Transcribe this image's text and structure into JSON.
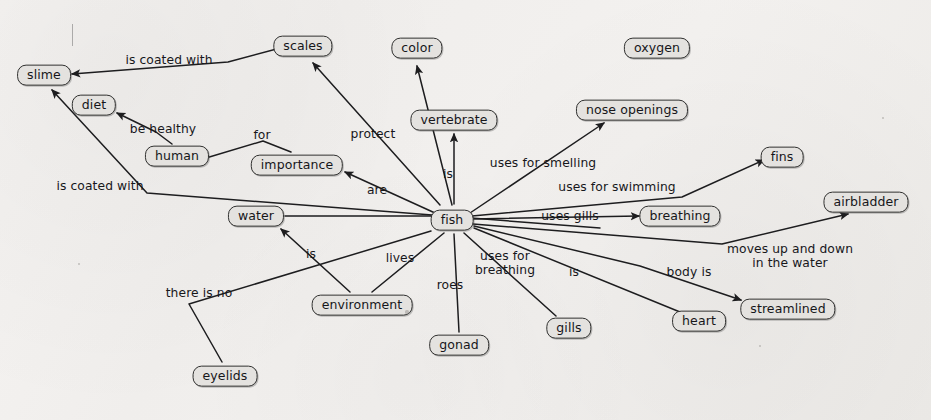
{
  "diagram": {
    "width": 931,
    "height": 420,
    "node_fill": "#e4e2df",
    "node_stroke": "#30302f",
    "edge_stroke": "#1d1d1f",
    "background": "#f2f0ee",
    "nodes": [
      {
        "id": "slime",
        "label": "slime",
        "x": 44,
        "y": 75
      },
      {
        "id": "diet",
        "label": "diet",
        "x": 94,
        "y": 105
      },
      {
        "id": "human",
        "label": "human",
        "x": 177,
        "y": 156
      },
      {
        "id": "scales",
        "label": "scales",
        "x": 303,
        "y": 46
      },
      {
        "id": "color",
        "label": "color",
        "x": 417,
        "y": 48
      },
      {
        "id": "oxygen",
        "label": "oxygen",
        "x": 657,
        "y": 48
      },
      {
        "id": "vertebrate",
        "label": "vertebrate",
        "x": 454,
        "y": 120
      },
      {
        "id": "nose_openings",
        "label": "nose openings",
        "x": 632,
        "y": 110
      },
      {
        "id": "importance",
        "label": "importance",
        "x": 297,
        "y": 165
      },
      {
        "id": "fins",
        "label": "fins",
        "x": 782,
        "y": 157
      },
      {
        "id": "airbladder",
        "label": "airbladder",
        "x": 866,
        "y": 202
      },
      {
        "id": "water",
        "label": "water",
        "x": 256,
        "y": 216
      },
      {
        "id": "fish",
        "label": "fish",
        "x": 452,
        "y": 220
      },
      {
        "id": "breathing",
        "label": "breathing",
        "x": 680,
        "y": 216
      },
      {
        "id": "environment",
        "label": "environment",
        "x": 362,
        "y": 305
      },
      {
        "id": "streamlined",
        "label": "streamlined",
        "x": 788,
        "y": 309
      },
      {
        "id": "heart",
        "label": "heart",
        "x": 699,
        "y": 321
      },
      {
        "id": "gills",
        "label": "gills",
        "x": 569,
        "y": 328
      },
      {
        "id": "gonad",
        "label": "gonad",
        "x": 459,
        "y": 345
      },
      {
        "id": "eyelids",
        "label": "eyelids",
        "x": 225,
        "y": 376
      }
    ],
    "edges": [
      {
        "id": "scales-slime",
        "from": "scales",
        "to": "slime",
        "label": "is coated with",
        "label_x": 169,
        "label_y": 60,
        "arrow": true,
        "points": "284,47 228,62 72,74"
      },
      {
        "id": "fish-scales",
        "from": "fish",
        "to": "scales",
        "label": "protect",
        "label_x": 373,
        "label_y": 134,
        "arrow": true,
        "points": "440,205 313,63"
      },
      {
        "id": "fish-color",
        "from": "fish",
        "to": "color",
        "label": "",
        "label_x": 0,
        "label_y": 0,
        "arrow": true,
        "points": "452,205 417,66"
      },
      {
        "id": "fish-vertebrate",
        "from": "fish",
        "to": "vertebrate",
        "label": "is",
        "label_x": 448,
        "label_y": 174,
        "arrow": true,
        "points": "454,204 454,134"
      },
      {
        "id": "fish-nose",
        "from": "fish",
        "to": "nose_openings",
        "label": "uses for smelling",
        "label_x": 543,
        "label_y": 163,
        "arrow": true,
        "points": "470,213 604,123"
      },
      {
        "id": "fish-fins",
        "from": "fish",
        "to": "fins",
        "label": "uses for swimming",
        "label_x": 617,
        "label_y": 187,
        "arrow": true,
        "points": "472,216 682,197 764,160"
      },
      {
        "id": "fish-breathing",
        "from": "fish",
        "to": "breathing",
        "label": "uses gills",
        "label_x": 570,
        "label_y": 216,
        "arrow": true,
        "points": "473,219 639,216"
      },
      {
        "id": "fish-airbladder",
        "from": "fish",
        "to": "airbladder",
        "label": "moves up and down\nin the water",
        "label_x": 790,
        "label_y": 256,
        "arrow": true,
        "points": "473,224 722,244 848,214"
      },
      {
        "id": "fish-importance",
        "from": "fish",
        "to": "importance",
        "label": "are",
        "label_x": 377,
        "label_y": 190,
        "arrow": true,
        "points": "435,213 345,172"
      },
      {
        "id": "fish-water",
        "from": "fish",
        "to": "water",
        "label": "",
        "label_x": 0,
        "label_y": 0,
        "arrow": false,
        "points": "432,216 285,216"
      },
      {
        "id": "fish-environment",
        "from": "fish",
        "to": "environment",
        "label": "lives",
        "label_x": 400,
        "label_y": 258,
        "arrow": false,
        "points": "444,233 372,292"
      },
      {
        "id": "fish-gonad",
        "from": "fish",
        "to": "gonad",
        "label": "roes",
        "label_x": 450,
        "label_y": 285,
        "arrow": false,
        "points": "454,234 459,332"
      },
      {
        "id": "fish-gills",
        "from": "fish",
        "to": "gills",
        "label": "uses for\nbreathing",
        "label_x": 505,
        "label_y": 263,
        "arrow": false,
        "points": "464,233 556,316"
      },
      {
        "id": "fish-heart",
        "from": "fish",
        "to": "heart",
        "label": "is",
        "label_x": 574,
        "label_y": 272,
        "arrow": false,
        "points": "474,228 680,312"
      },
      {
        "id": "fish-streamlined",
        "from": "fish",
        "to": "streamlined",
        "label": "body is",
        "label_x": 689,
        "label_y": 272,
        "arrow": true,
        "points": "474,226 640,266 741,300"
      },
      {
        "id": "human-diet",
        "from": "human",
        "to": "diet",
        "label": "be healthy",
        "label_x": 163,
        "label_y": 129,
        "arrow": true,
        "points": "172,144 156,132 117,113"
      },
      {
        "id": "human-importance",
        "from": "human",
        "to": "importance",
        "label": "for",
        "label_x": 262,
        "label_y": 135,
        "arrow": false,
        "points": "206,158 263,141 291,152"
      },
      {
        "id": "water-slime",
        "from": "water",
        "to": "slime",
        "label": "is coated with",
        "label_x": 100,
        "label_y": 186,
        "arrow": true,
        "points": "600,228 147,193 52,90"
      },
      {
        "id": "environment-water",
        "from": "environment",
        "to": "water",
        "label": "is",
        "label_x": 311,
        "label_y": 254,
        "arrow": true,
        "points": "350,292 281,229"
      },
      {
        "id": "eyelids-fish",
        "from": "eyelids",
        "to": "fish",
        "label": "there is no",
        "label_x": 199,
        "label_y": 293,
        "arrow": false,
        "points": "222,362 189,304 431,231"
      }
    ],
    "specks": [
      {
        "x": 407,
        "y": 312,
        "r": 1.6
      },
      {
        "x": 760,
        "y": 346,
        "r": 1.3
      },
      {
        "x": 79,
        "y": 264,
        "r": 1.1
      },
      {
        "x": 883,
        "y": 118,
        "r": 1.2
      }
    ]
  }
}
